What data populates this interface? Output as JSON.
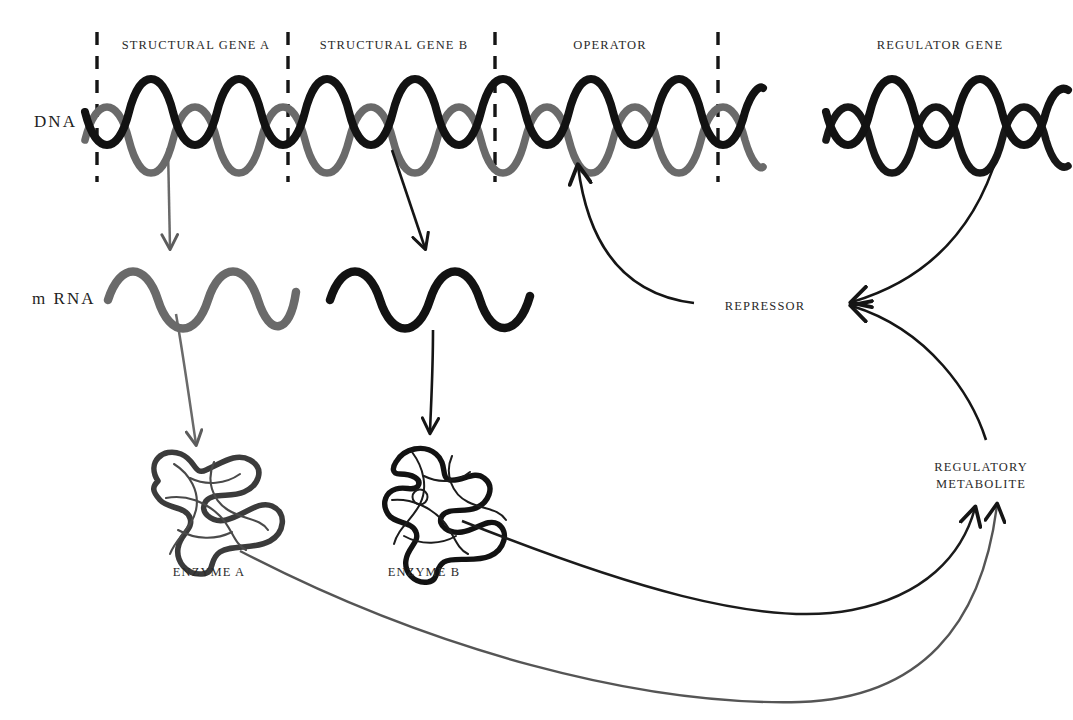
{
  "figure": {
    "type": "diagram",
    "background_color": "#ffffff",
    "ink_black": "#151515",
    "ink_gray": "#5c5c5c"
  },
  "row_labels": {
    "dna": "DNA",
    "mrna": "m RNA"
  },
  "segment_labels": [
    {
      "text": "STRUCTURAL GENE A",
      "x": 196,
      "y": 44
    },
    {
      "text": "STRUCTURAL GENE B",
      "x": 394,
      "y": 44
    },
    {
      "text": "OPERATOR",
      "x": 610,
      "y": 44
    },
    {
      "text": "REGULATOR GENE",
      "x": 940,
      "y": 44
    }
  ],
  "node_labels": [
    {
      "text": "ENZYME A",
      "x": 209,
      "y": 572
    },
    {
      "text": "ENZYME B",
      "x": 424,
      "y": 572
    },
    {
      "text": "REPRESSOR",
      "x": 765,
      "y": 307
    }
  ],
  "metabolite_label": {
    "line1": "REGULATORY",
    "line2": "METABOLITE",
    "x": 981,
    "y": 466
  },
  "divider_lines_x": [
    97,
    288,
    495,
    718
  ],
  "flow": {
    "transcription_a": "DNA structural gene A to mRNA A",
    "transcription_b": "DNA structural gene B to mRNA B",
    "translation_a": "mRNA A to Enzyme A",
    "translation_b": "mRNA B to Enzyme B",
    "repressor_to_operator": "REPRESSOR to OPERATOR",
    "regulator_gene_to_repressor": "REGULATOR GENE to REPRESSOR",
    "metabolite_to_repressor": "REGULATORY METABOLITE to REPRESSOR",
    "enzyme_a_to_metabolite": "ENZYME A to REGULATORY METABOLITE",
    "enzyme_b_to_metabolite": "ENZYME B to REGULATORY METABOLITE"
  }
}
